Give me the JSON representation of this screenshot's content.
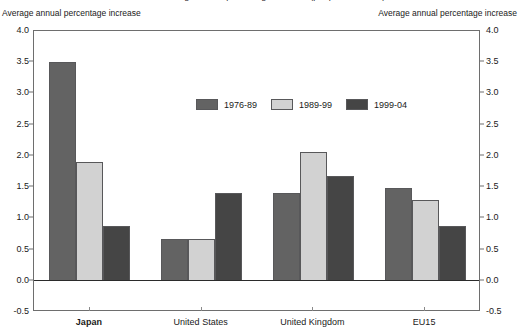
{
  "title": "Chart: average annual percentage increase (per period shown)",
  "axis_caption_left": "Average annual percentage increase",
  "axis_caption_right": "Average annual percentage increase",
  "chart_data": {
    "type": "bar",
    "title": "Chart: average annual percentage increase (per period shown)",
    "xlabel": "",
    "ylabel": "Average annual percentage increase",
    "ylim": [
      -0.5,
      4.0
    ],
    "yticks": [
      "-0.5",
      "0.0",
      "0.5",
      "1.0",
      "1.5",
      "2.0",
      "2.5",
      "3.0",
      "3.5",
      "4.0"
    ],
    "ytick_values": [
      -0.5,
      0.0,
      0.5,
      1.0,
      1.5,
      2.0,
      2.5,
      3.0,
      3.5,
      4.0
    ],
    "grid": false,
    "legend_position": "upper center",
    "categories": [
      "Japan",
      "United States",
      "United Kingdom",
      "EU15"
    ],
    "emphasized_category": "Japan",
    "series": [
      {
        "name": "1976-89",
        "color": "#636363",
        "values": [
          3.5,
          0.67,
          1.4,
          1.49
        ]
      },
      {
        "name": "1989-99",
        "color": "#d2d2d2",
        "values": [
          1.9,
          0.67,
          2.07,
          1.3
        ]
      },
      {
        "name": "1999-04",
        "color": "#454545",
        "values": [
          0.88,
          1.4,
          1.68,
          0.88
        ]
      }
    ]
  }
}
